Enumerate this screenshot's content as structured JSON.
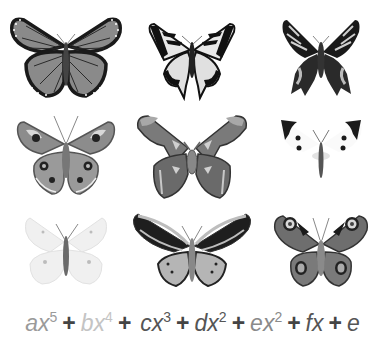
{
  "figure": {
    "grid": {
      "rows": 3,
      "columns": 3,
      "cells": [
        {
          "row": 1,
          "col": 1,
          "subject": "monarch-butterfly",
          "tone": "medium-gray"
        },
        {
          "row": 1,
          "col": 2,
          "subject": "swallowtail-butterfly",
          "tone": "black-and-white"
        },
        {
          "row": 1,
          "col": 3,
          "subject": "dark-swallowtail-moth",
          "tone": "dark"
        },
        {
          "row": 2,
          "col": 1,
          "subject": "buckeye-butterfly",
          "tone": "medium-gray"
        },
        {
          "row": 2,
          "col": 2,
          "subject": "atlas-moth",
          "tone": "medium-gray"
        },
        {
          "row": 2,
          "col": 3,
          "subject": "white-cabbage-butterfly",
          "tone": "white-with-black-tips"
        },
        {
          "row": 3,
          "col": 1,
          "subject": "pale-white-butterfly",
          "tone": "very-light"
        },
        {
          "row": 3,
          "col": 2,
          "subject": "birdwing-butterfly",
          "tone": "dark-and-light"
        },
        {
          "row": 3,
          "col": 3,
          "subject": "peacock-butterfly",
          "tone": "medium-dark"
        }
      ]
    },
    "formula": {
      "terms": [
        {
          "coef": "a",
          "var": "x",
          "exp": "5",
          "color": "#9a9a9a"
        },
        {
          "coef": "b",
          "var": "x",
          "exp": "4",
          "color": "#c4c4c4"
        },
        {
          "coef": "c",
          "var": "x",
          "exp": "3",
          "color": "#555555"
        },
        {
          "coef": "d",
          "var": "x",
          "exp": "2",
          "color": "#555555"
        },
        {
          "coef": "e",
          "var": "x",
          "exp": "2",
          "color": "#8a8a8a"
        },
        {
          "coef": "f",
          "var": "x",
          "exp": "",
          "color": "#555555"
        },
        {
          "coef": "e",
          "var": "",
          "exp": "",
          "color": "#555555"
        }
      ],
      "operator": "+"
    }
  }
}
